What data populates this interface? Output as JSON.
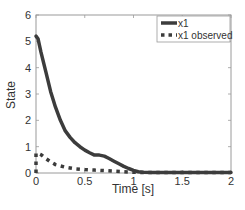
{
  "chart_data": {
    "type": "line",
    "title": "",
    "xlabel": "Time [s]",
    "ylabel": "State",
    "xlim": [
      0,
      2
    ],
    "ylim": [
      0,
      6
    ],
    "xticks": [
      0,
      0.5,
      1,
      1.5,
      2
    ],
    "xtick_labels": [
      "0",
      "0.5",
      "1",
      "1.5",
      "2"
    ],
    "yticks": [
      0,
      1,
      2,
      3,
      4,
      5,
      6
    ],
    "ytick_labels": [
      "0",
      "1",
      "2",
      "3",
      "4",
      "5",
      "6"
    ],
    "grid": false,
    "legend_position": "upper right",
    "series": [
      {
        "name": "x1",
        "style": "solid",
        "color": "#3c3c3c",
        "x": [
          0,
          0.02,
          0.05,
          0.1,
          0.15,
          0.2,
          0.25,
          0.3,
          0.35,
          0.4,
          0.45,
          0.5,
          0.55,
          0.6,
          0.65,
          0.7,
          0.75,
          0.8,
          0.85,
          0.9,
          0.95,
          1.0,
          1.05,
          1.1,
          1.2,
          1.4,
          1.6,
          1.8,
          2.0
        ],
        "y": [
          5.2,
          5.1,
          4.6,
          3.85,
          3.1,
          2.5,
          2.0,
          1.6,
          1.35,
          1.15,
          1.0,
          0.87,
          0.77,
          0.68,
          0.68,
          0.64,
          0.55,
          0.45,
          0.35,
          0.25,
          0.17,
          0.1,
          0.05,
          0.03,
          0.02,
          0.02,
          0.02,
          0.02,
          0.02
        ]
      },
      {
        "name": "x1 observed",
        "style": "dotted",
        "color": "#3c3c3c",
        "x": [
          0,
          0,
          0.02,
          0.05,
          0.1,
          0.15,
          0.2,
          0.3,
          0.4,
          0.5,
          0.6,
          0.7,
          0.8,
          0.9,
          1.0,
          1.1,
          1.2,
          1.4,
          1.6,
          1.8,
          2.0
        ],
        "y": [
          0,
          0.75,
          0.75,
          0.7,
          0.55,
          0.42,
          0.32,
          0.22,
          0.16,
          0.13,
          0.11,
          0.09,
          0.07,
          0.05,
          0.03,
          0.02,
          0.02,
          0.02,
          0.02,
          0.02,
          0.02
        ]
      }
    ]
  }
}
